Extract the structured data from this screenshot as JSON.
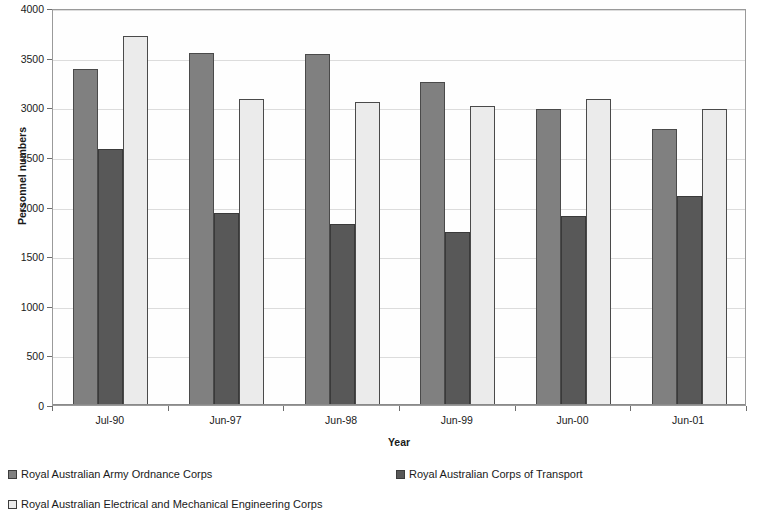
{
  "chart_data": {
    "type": "bar",
    "title": "",
    "xlabel": "Year",
    "ylabel": "Personnel numbers",
    "categories": [
      "Jul-90",
      "Jun-97",
      "Jun-98",
      "Jun-99",
      "Jun-00",
      "Jun-01"
    ],
    "ylim": [
      0,
      4000
    ],
    "yticks": [
      0,
      500,
      1000,
      1500,
      2000,
      2500,
      3000,
      3500,
      4000
    ],
    "ytick_labels": [
      "0",
      "500",
      "1000",
      "1500",
      "2000",
      "2500",
      "3000",
      "3500",
      "4000"
    ],
    "grid": true,
    "legend_position": "bottom",
    "series": [
      {
        "name": "Royal Australian Army Ordnance Corps",
        "color": "#808080",
        "border": "#4a4a4a",
        "values": [
          3390,
          3550,
          3540,
          3250,
          2980,
          2780
        ]
      },
      {
        "name": "Royal Australian Corps of Transport",
        "color": "#585858",
        "border": "#3a3a3a",
        "values": [
          2580,
          1930,
          1820,
          1740,
          1905,
          2105
        ]
      },
      {
        "name": "Royal Australian Electrical and Mechanical Engineering Corps",
        "color": "#ebebeb",
        "border": "#4a4a4a",
        "values": [
          3720,
          3085,
          3050,
          3015,
          3080,
          2980
        ]
      }
    ]
  },
  "legend": {
    "items": [
      {
        "label": "Royal Australian Army Ordnance Corps",
        "color": "#808080"
      },
      {
        "label": "Royal Australian Corps of Transport",
        "color": "#585858"
      },
      {
        "label": "Royal Australian Electrical and Mechanical Engineering Corps",
        "color": "#ebebeb"
      }
    ]
  }
}
